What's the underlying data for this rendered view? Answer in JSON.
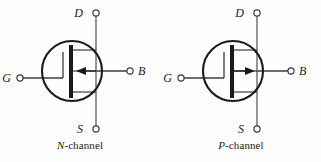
{
  "figure": {
    "type": "circuit-symbol-diagram",
    "background_color": "#fefefe",
    "line_color": "#3b3b4a",
    "bold_line_color": "#1a1a1a",
    "text_color": "#1a1a1a"
  },
  "symbols": [
    {
      "id": "n-channel",
      "caption_prefix": "N",
      "caption_suffix": "-channel",
      "caption": "N-channel",
      "arrow_direction": "left",
      "arrow_meaning": "body arrow points inward toward channel",
      "terminals": [
        {
          "name": "drain",
          "label": "D",
          "position": "top"
        },
        {
          "name": "gate",
          "label": "G",
          "position": "left"
        },
        {
          "name": "source",
          "label": "S",
          "position": "bottom"
        },
        {
          "name": "body",
          "label": "B",
          "position": "right"
        }
      ]
    },
    {
      "id": "p-channel",
      "caption_prefix": "P",
      "caption_suffix": "-channel",
      "caption": "P-channel",
      "arrow_direction": "right",
      "arrow_meaning": "body arrow points outward away from channel",
      "terminals": [
        {
          "name": "drain",
          "label": "D",
          "position": "top"
        },
        {
          "name": "gate",
          "label": "G",
          "position": "left"
        },
        {
          "name": "source",
          "label": "S",
          "position": "bottom"
        },
        {
          "name": "body",
          "label": "B",
          "position": "right"
        }
      ]
    }
  ]
}
